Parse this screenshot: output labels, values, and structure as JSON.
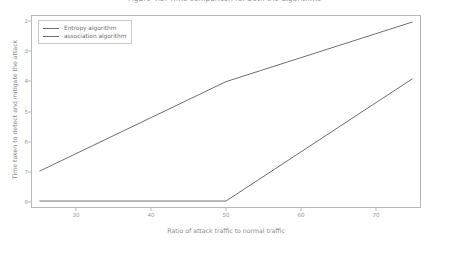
{
  "figure": {
    "title": "Figure 4.2. Time comparison for both the algorithms",
    "background_color": "#ffffff",
    "axes_border_color": "#b9b9bd",
    "line_color": "#6f6f76"
  },
  "legend": {
    "position": "upper-left",
    "entries": [
      {
        "label": "Entropy algorithm",
        "color": "#6f6f76"
      },
      {
        "label": "association algorithm",
        "color": "#6f6f76"
      }
    ]
  },
  "axis": {
    "xlabel": "Ratio of attack traffic to normal traffic",
    "ylabel": "Time taken to detect and mitigate the attack",
    "xticks": [
      "30",
      "40",
      "50",
      "60",
      "70"
    ],
    "yticks": [
      "8",
      "7",
      "6",
      "5",
      "4",
      "3",
      "2"
    ]
  },
  "chart_data": {
    "type": "line",
    "title": "Figure 4.2. Time comparison for both the algorithms",
    "xlabel": "Ratio of attack traffic to normal traffic",
    "ylabel": "Time taken to detect and mitigate the attack",
    "xlim": [
      24,
      76
    ],
    "ylim": [
      1.8,
      8.2
    ],
    "xticks": [
      30,
      40,
      50,
      60,
      70
    ],
    "yticks": [
      2,
      3,
      4,
      5,
      6,
      7,
      8
    ],
    "grid": false,
    "legend_position": "upper left",
    "series": [
      {
        "name": "Entropy algorithm",
        "color": "#6f6f76",
        "x": [
          25,
          50,
          75
        ],
        "values": [
          3.0,
          6.0,
          8.0
        ]
      },
      {
        "name": "association algorithm",
        "color": "#6f6f76",
        "x": [
          25,
          50,
          75
        ],
        "values": [
          2.0,
          2.0,
          6.1
        ]
      }
    ]
  }
}
